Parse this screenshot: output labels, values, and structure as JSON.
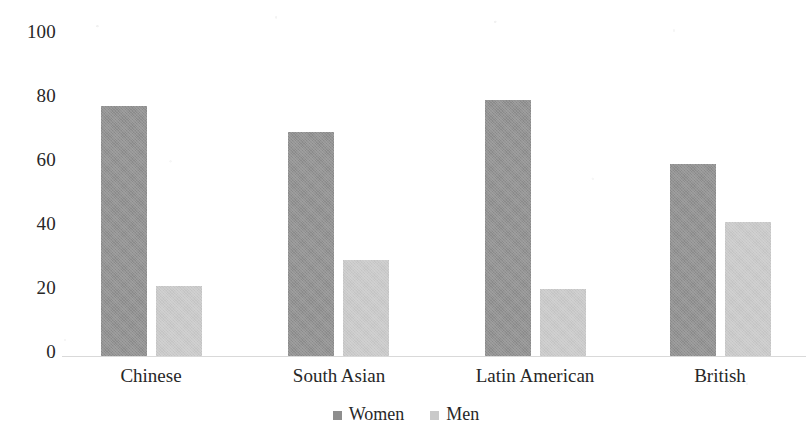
{
  "chart_data": {
    "type": "bar",
    "title": "",
    "subtitle": "",
    "xlabel": "",
    "ylabel": "",
    "categories": [
      "Chinese",
      "South Asian",
      "Latin American",
      "British"
    ],
    "series": [
      {
        "name": "Women",
        "values": [
          78,
          70,
          80,
          60
        ],
        "color": "#8e8e8e"
      },
      {
        "name": "Men",
        "values": [
          22,
          30,
          21,
          42
        ],
        "color": "#c9c9c9"
      }
    ],
    "ylim": [
      0,
      100
    ],
    "ytick_values": [
      100,
      80,
      60,
      40,
      20,
      0
    ],
    "ytick_labels": [
      "100",
      "80",
      "60",
      "40",
      "20",
      "0"
    ],
    "grid": false,
    "legend_position": "bottom-center",
    "background_color": "#ffffff",
    "axis_color": "#d9d9d9"
  },
  "y_axis": {
    "ticks": [
      {
        "label": "100",
        "value": 100
      },
      {
        "label": "80",
        "value": 80
      },
      {
        "label": "60",
        "value": 60
      },
      {
        "label": "40",
        "value": 40
      },
      {
        "label": "20",
        "value": 20
      },
      {
        "label": "0",
        "value": 0
      }
    ]
  },
  "x_axis": {
    "categories": [
      {
        "label": "Chinese"
      },
      {
        "label": "South Asian"
      },
      {
        "label": "Latin American"
      },
      {
        "label": "British"
      }
    ]
  },
  "legend": {
    "entries": [
      {
        "label": "Women",
        "color": "#8e8e8e"
      },
      {
        "label": "Men",
        "color": "#c9c9c9"
      }
    ]
  },
  "bars": {
    "chinese_women": 78,
    "chinese_men": 22,
    "south_asian_women": 70,
    "south_asian_men": 30,
    "latin_american_women": 80,
    "latin_american_men": 21,
    "british_women": 60,
    "british_men": 42
  }
}
